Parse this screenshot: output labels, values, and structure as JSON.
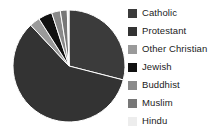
{
  "chart_data": {
    "type": "pie",
    "title": "",
    "legend_position": "right",
    "grid": false,
    "categories": [
      "Catholic",
      "Protestant",
      "Other Christian",
      "Jewish",
      "Buddhist",
      "Muslim",
      "Hindu"
    ],
    "values": [
      29,
      59,
      3,
      4,
      2.5,
      2,
      0.5
    ],
    "colors": [
      "#3b3b3b",
      "#333333",
      "#9a9a9a",
      "#111111",
      "#8a8a8a",
      "#777777",
      "#ededed"
    ],
    "slices": [
      {
        "label": "Catholic",
        "value": 29,
        "color": "#3b3b3b",
        "start_angle": 0,
        "end_angle": 104.4
      },
      {
        "label": "Protestant",
        "value": 59,
        "color": "#333333",
        "start_angle": 104.4,
        "end_angle": 316.8
      },
      {
        "label": "Other Christian",
        "value": 3,
        "color": "#9a9a9a",
        "start_angle": 316.8,
        "end_angle": 327.6
      },
      {
        "label": "Jewish",
        "value": 4,
        "color": "#111111",
        "start_angle": 327.6,
        "end_angle": 342.0
      },
      {
        "label": "Buddhist",
        "value": 2.5,
        "color": "#8a8a8a",
        "start_angle": 342.0,
        "end_angle": 351.0
      },
      {
        "label": "Muslim",
        "value": 2,
        "color": "#777777",
        "start_angle": 351.0,
        "end_angle": 358.2
      },
      {
        "label": "Hindu",
        "value": 0.5,
        "color": "#ededed",
        "start_angle": 358.2,
        "end_angle": 360.0
      }
    ]
  },
  "legend": {
    "items": [
      {
        "label": "Catholic",
        "color": "#3b3b3b"
      },
      {
        "label": "Protestant",
        "color": "#333333"
      },
      {
        "label": "Other Christian",
        "color": "#9a9a9a"
      },
      {
        "label": "Jewish",
        "color": "#111111"
      },
      {
        "label": "Buddhist",
        "color": "#8a8a8a"
      },
      {
        "label": "Muslim",
        "color": "#777777"
      },
      {
        "label": "Hindu",
        "color": "#ededed"
      }
    ]
  }
}
